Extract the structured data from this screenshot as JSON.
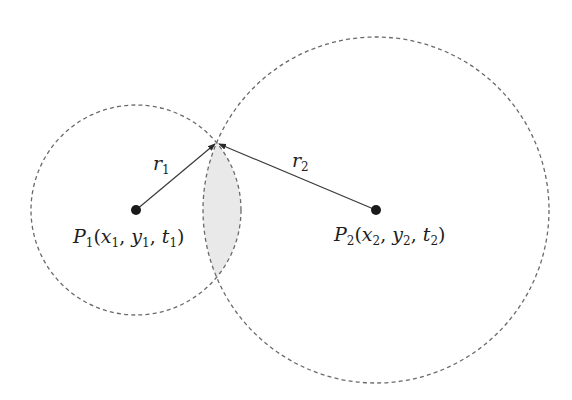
{
  "diagram": {
    "type": "two-circle-intersection",
    "background": "#ffffff",
    "circles": [
      {
        "id": "c1",
        "cx": 136,
        "cy": 210,
        "r": 105,
        "style": "dashed"
      },
      {
        "id": "c2",
        "cx": 376,
        "cy": 210,
        "r": 173,
        "style": "dashed"
      }
    ],
    "intersection_point": {
      "x": 217,
      "y": 143
    },
    "overlap_fill": "#e9e9e9",
    "points": [
      {
        "id": "P1",
        "label_main": "P",
        "label_sub": "1",
        "coords": [
          "x",
          "1",
          "y",
          "1",
          "t",
          "1"
        ],
        "x": 136,
        "y": 210
      },
      {
        "id": "P2",
        "label_main": "P",
        "label_sub": "2",
        "coords": [
          "x",
          "2",
          "y",
          "2",
          "t",
          "2"
        ],
        "x": 376,
        "y": 210
      }
    ],
    "radii": [
      {
        "label_main": "r",
        "label_sub": "1",
        "from": "P1",
        "to": "intersection"
      },
      {
        "label_main": "r",
        "label_sub": "2",
        "from": "P2",
        "to": "intersection"
      }
    ],
    "labels": {
      "p1": {
        "P": "P",
        "s": "1",
        "open": "(",
        "x": "x",
        "xs": "1",
        "c1": ", ",
        "y": "y",
        "ys": "1",
        "c2": ", ",
        "t": "t",
        "ts": "1",
        "close": ")"
      },
      "p2": {
        "P": "P",
        "s": "2",
        "open": "(",
        "x": "x",
        "xs": "2",
        "c1": ", ",
        "y": "y",
        "ys": "2",
        "c2": ", ",
        "t": "t",
        "ts": "2",
        "close": ")"
      },
      "r1": {
        "r": "r",
        "s": "1"
      },
      "r2": {
        "r": "r",
        "s": "2"
      }
    }
  }
}
